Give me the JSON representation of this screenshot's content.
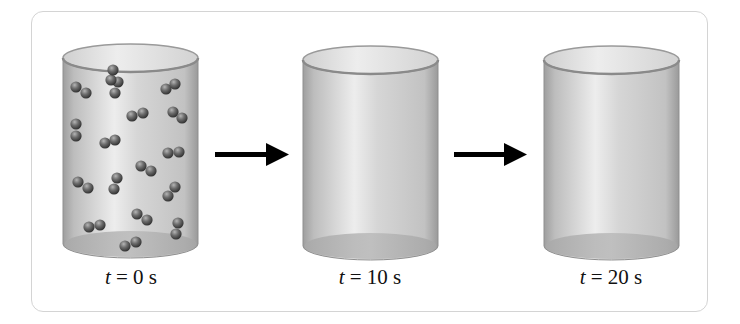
{
  "diagram": {
    "type": "process-sequence",
    "colors": {
      "frame_border": "#d4d4d4",
      "cylinder_fill": "#c9c9c9",
      "cylinder_highlight": "#ececec",
      "cylinder_edge": "#8f8f8f",
      "molecule_light": "#9a9a9a",
      "molecule_dark": "#353535",
      "arrow": "#000000"
    },
    "stages": [
      {
        "id": "stage-1",
        "time_var": "t",
        "time_eq": " = 0 s",
        "molecule_count": 17,
        "molecule_type": "diatomic"
      },
      {
        "id": "stage-2",
        "time_var": "t",
        "time_eq": " = 10 s",
        "molecule_count": 0
      },
      {
        "id": "stage-3",
        "time_var": "t",
        "time_eq": " = 20 s",
        "molecule_count": 0
      }
    ],
    "arrows": [
      {
        "from": "stage-1",
        "to": "stage-2",
        "icon": "right-arrow-icon"
      },
      {
        "from": "stage-2",
        "to": "stage-3",
        "icon": "right-arrow-icon"
      }
    ]
  }
}
